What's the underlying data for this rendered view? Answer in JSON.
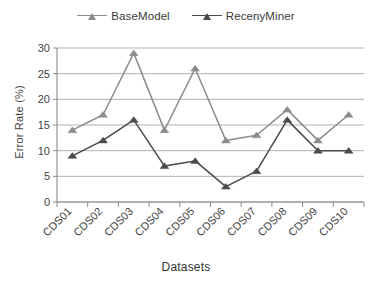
{
  "legend": {
    "position": "top-center",
    "entries": [
      {
        "label": "BaseModel",
        "color": "#8c8c8c",
        "marker": "triangle-up"
      },
      {
        "label": "RecenyMiner",
        "color": "#4a4a4a",
        "marker": "triangle-up"
      }
    ]
  },
  "axes": {
    "ylabel": "Error Rate (%)",
    "xlabel": "Datasets"
  },
  "chart_data": {
    "type": "line",
    "title": "",
    "xlabel": "Datasets",
    "ylabel": "Error Rate (%)",
    "categories": [
      "CDS01",
      "CDS02",
      "CDS03",
      "CDS04",
      "CDS05",
      "CDS06",
      "CDS07",
      "CDS08",
      "CDS09",
      "CDS10"
    ],
    "series": [
      {
        "name": "BaseModel",
        "color": "#8c8c8c",
        "marker": "triangle-up",
        "values": [
          14,
          17,
          29,
          14,
          26,
          12,
          13,
          18,
          12,
          17
        ]
      },
      {
        "name": "RecenyMiner",
        "color": "#4a4a4a",
        "marker": "triangle-up",
        "values": [
          9,
          12,
          16,
          7,
          8,
          3,
          6,
          16,
          10,
          10
        ]
      }
    ],
    "ylim": [
      0,
      30
    ],
    "yticks": [
      0,
      5,
      10,
      15,
      20,
      25,
      30
    ],
    "ytick_labels": [
      "0",
      "5",
      "10",
      "15",
      "20",
      "25",
      "30"
    ],
    "grid": {
      "horizontal": true,
      "vertical": false
    },
    "legend_position": "top-center",
    "xtick_rotation": -45
  }
}
